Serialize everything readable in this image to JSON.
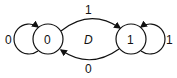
{
  "diagram": {
    "type": "state-transition",
    "center_label": "D",
    "states": [
      {
        "id": "s0",
        "label": "0"
      },
      {
        "id": "s1",
        "label": "1"
      }
    ],
    "transitions": [
      {
        "from": "s0",
        "to": "s0",
        "label": "0"
      },
      {
        "from": "s0",
        "to": "s1",
        "label": "1"
      },
      {
        "from": "s1",
        "to": "s0",
        "label": "0"
      },
      {
        "from": "s1",
        "to": "s1",
        "label": "1"
      }
    ],
    "colors": {
      "line": "#111111",
      "background": "#ffffff"
    }
  }
}
